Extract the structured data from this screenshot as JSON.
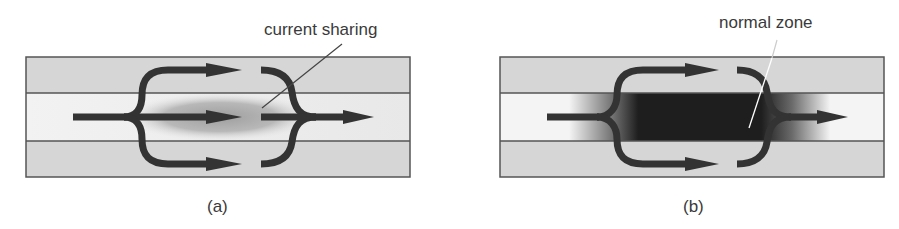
{
  "figure": {
    "panels": [
      {
        "id": "a",
        "caption": "(a)",
        "annotation": "current sharing",
        "central_region": "partially resistive (gray gradient)"
      },
      {
        "id": "b",
        "caption": "(b)",
        "annotation": "normal zone",
        "central_region": "fully normal (dark)"
      }
    ],
    "layers": [
      "stabilizer (top)",
      "superconductor (middle)",
      "stabilizer (bottom)"
    ],
    "colors": {
      "outer_layer": "#d4d4d4",
      "middle_layer": "#ececec",
      "line": "#555555",
      "arrow": "#333333",
      "normal_zone": "#1e1e1e"
    }
  }
}
